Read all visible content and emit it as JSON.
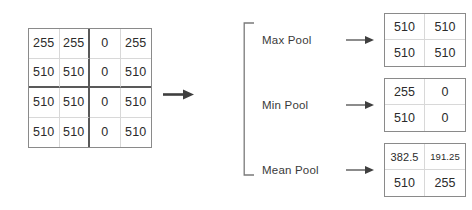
{
  "input_matrix": {
    "name": "input-feature-map",
    "rows": [
      [
        "255",
        "255",
        "0",
        "255"
      ],
      [
        "510",
        "510",
        "0",
        "510"
      ],
      [
        "510",
        "510",
        "0",
        "510"
      ],
      [
        "510",
        "510",
        "0",
        "510"
      ]
    ]
  },
  "flow": {
    "main_arrow": "arrow-right",
    "bracket": "bracket-right",
    "branch_arrow": "arrow-right"
  },
  "operations": [
    {
      "label": "Max Pool",
      "output": {
        "rows": [
          [
            "510",
            "510"
          ],
          [
            "510",
            "510"
          ]
        ]
      }
    },
    {
      "label": "Min Pool",
      "output": {
        "rows": [
          [
            "255",
            "0"
          ],
          [
            "510",
            "0"
          ]
        ]
      }
    },
    {
      "label": "Mean Pool",
      "output": {
        "rows": [
          [
            "382.5",
            "191.25"
          ],
          [
            "510",
            "255"
          ]
        ]
      }
    }
  ],
  "colors": {
    "cell_text": "#2b2b2b",
    "label_text": "#3a3a3a",
    "outer_border": "#8a8a8a",
    "inner_border": "#d8d8d8",
    "quadrant_border": "#595959",
    "arrow": "#3f3f3f",
    "bracket": "#7a7a7a",
    "background": "#ffffff"
  }
}
